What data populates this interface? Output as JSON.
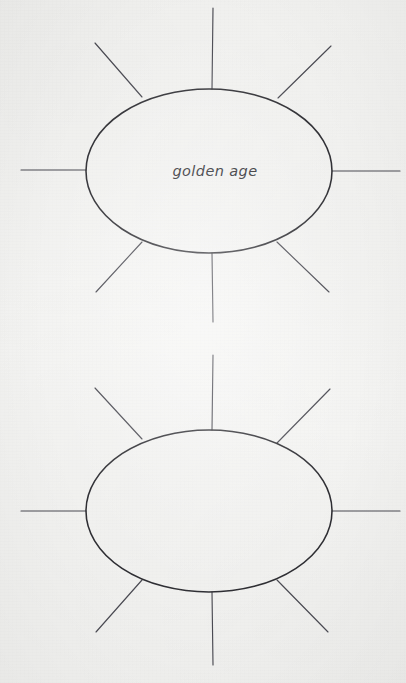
{
  "page": {
    "background_color": "#f4f4f2",
    "ink_color": "#2e2e33",
    "ray_color": "#4a4a52",
    "width": 406,
    "height": 683,
    "medium": "scanned paper worksheet"
  },
  "diagrams": [
    {
      "id": "web-1",
      "name": "word-web-top",
      "shape": "ellipse",
      "center_label": "golden age",
      "center": {
        "x": 209,
        "y": 171
      },
      "radius_x": 123,
      "radius_y": 82,
      "ray_count": 8,
      "rays": [
        {
          "name": "ray-top",
          "direction": "up",
          "x1": 212,
          "y1": 89,
          "x2": 213,
          "y2": 8
        },
        {
          "name": "ray-top-right",
          "direction": "up-right",
          "x1": 278,
          "y1": 98,
          "x2": 331,
          "y2": 46
        },
        {
          "name": "ray-right",
          "direction": "right",
          "x1": 332,
          "y1": 171,
          "x2": 400,
          "y2": 171
        },
        {
          "name": "ray-bottom-right",
          "direction": "down-right",
          "x1": 277,
          "y1": 242,
          "x2": 329,
          "y2": 292
        },
        {
          "name": "ray-bottom",
          "direction": "down",
          "x1": 212,
          "y1": 253,
          "x2": 213,
          "y2": 322
        },
        {
          "name": "ray-bottom-left",
          "direction": "down-left",
          "x1": 142,
          "y1": 242,
          "x2": 96,
          "y2": 292
        },
        {
          "name": "ray-left",
          "direction": "left",
          "x1": 86,
          "y1": 170,
          "x2": 21,
          "y2": 170
        },
        {
          "name": "ray-top-left",
          "direction": "up-left",
          "x1": 142,
          "y1": 97,
          "x2": 95,
          "y2": 43
        }
      ]
    },
    {
      "id": "web-2",
      "name": "word-web-bottom",
      "shape": "ellipse",
      "center_label": "",
      "center": {
        "x": 209,
        "y": 511
      },
      "radius_x": 123,
      "radius_y": 81,
      "ray_count": 8,
      "rays": [
        {
          "name": "ray-top",
          "direction": "up",
          "x1": 212,
          "y1": 430,
          "x2": 213,
          "y2": 355
        },
        {
          "name": "ray-top-right",
          "direction": "up-right",
          "x1": 277,
          "y1": 443,
          "x2": 330,
          "y2": 389
        },
        {
          "name": "ray-right",
          "direction": "right",
          "x1": 332,
          "y1": 511,
          "x2": 400,
          "y2": 511
        },
        {
          "name": "ray-bottom-right",
          "direction": "down-right",
          "x1": 277,
          "y1": 580,
          "x2": 328,
          "y2": 632
        },
        {
          "name": "ray-bottom",
          "direction": "down",
          "x1": 212,
          "y1": 592,
          "x2": 213,
          "y2": 665
        },
        {
          "name": "ray-bottom-left",
          "direction": "down-left",
          "x1": 142,
          "y1": 580,
          "x2": 96,
          "y2": 632
        },
        {
          "name": "ray-left",
          "direction": "left",
          "x1": 86,
          "y1": 511,
          "x2": 21,
          "y2": 511
        },
        {
          "name": "ray-top-left",
          "direction": "up-left",
          "x1": 142,
          "y1": 439,
          "x2": 95,
          "y2": 388
        }
      ]
    }
  ]
}
